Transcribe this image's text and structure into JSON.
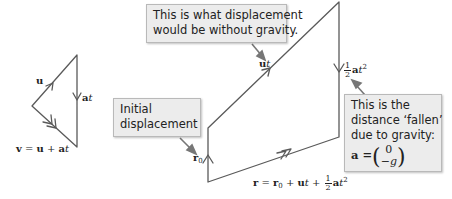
{
  "colors": {
    "line": "#5a5a5a",
    "callout_bg": "#ececec",
    "callout_border": "#b9b9b9",
    "pointer": "#777777"
  },
  "callouts": {
    "top": {
      "lines": [
        "This is what displacement",
        "would be without gravity."
      ]
    },
    "initial": {
      "lines": [
        "Initial",
        "displacement"
      ]
    },
    "fallen": {
      "lines": [
        "This is the",
        "distance ‘fallen’",
        "due to gravity:"
      ],
      "eq_lhs": "a =",
      "vec_top": "0",
      "vec_bottom": "−g"
    }
  },
  "labels": {
    "u": "u",
    "at": {
      "a": "a",
      "t": "t"
    },
    "v_eq": {
      "v": "v",
      "eq": " = ",
      "u": "u",
      "plus": " + ",
      "a": "a",
      "t": "t"
    },
    "ut": {
      "u": "u",
      "t": "t"
    },
    "half_at2": {
      "num": "1",
      "den": "2",
      "a": "a",
      "t": "t",
      "exp": "2"
    },
    "r0": {
      "r": "r",
      "sub": "0"
    },
    "r_eq": {
      "r": "r",
      "eq": " = ",
      "r0": "r",
      "sub": "0",
      "plus1": " + ",
      "u": "u",
      "t1": "t",
      "plus2": " + ",
      "num": "1",
      "den": "2",
      "a": "a",
      "t2": "t",
      "exp": "2"
    }
  }
}
